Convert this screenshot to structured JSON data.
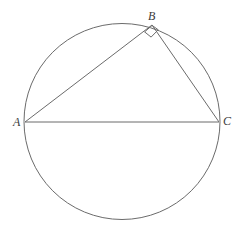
{
  "figure": {
    "name": "inscribed-right-triangle-in-circle",
    "background_color": "#ffffff",
    "stroke_color": "#6b6b6b",
    "label_color": "#3a3a3a",
    "stroke_width": 1,
    "width": 245,
    "height": 234
  },
  "circle": {
    "center_x": 122,
    "center_y": 121.5,
    "radius": 98
  },
  "points": {
    "A": {
      "label": "A",
      "x": 25,
      "y": 122
    },
    "B": {
      "label": "B",
      "x": 152,
      "y": 25
    },
    "C": {
      "label": "C",
      "x": 219,
      "y": 122
    }
  },
  "segments": [
    {
      "name": "segment-AB",
      "from": "A",
      "to": "B",
      "x1": 25,
      "y1": 122,
      "x2": 152,
      "y2": 25
    },
    {
      "name": "segment-BC",
      "from": "B",
      "to": "C",
      "x1": 152,
      "y1": 25,
      "x2": 219,
      "y2": 122
    },
    {
      "name": "segment-AC",
      "from": "A",
      "to": "C",
      "x1": 25,
      "y1": 122,
      "x2": 219,
      "y2": 122
    }
  ],
  "right_angle_marker": {
    "at_vertex": "B",
    "angle_degrees": 90,
    "path": "M 144.6,31.9 L 151.1,37.1 L 158.2,29.8 L 152.1,25.4 Z"
  }
}
